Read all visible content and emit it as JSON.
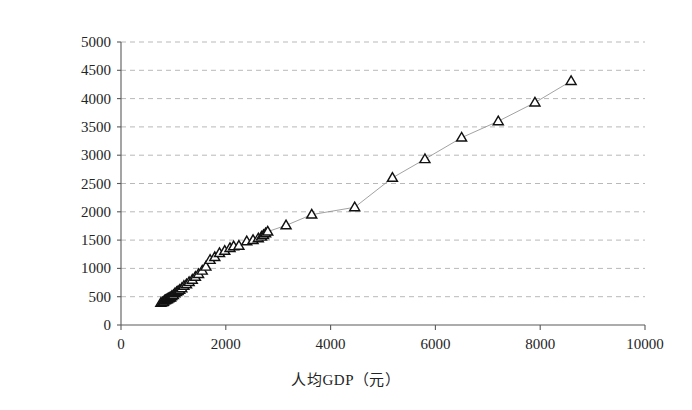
{
  "chart_data": {
    "type": "scatter",
    "title": "",
    "subtitle": "",
    "xlabel": "人均GDP（元）",
    "ylabel": "人均消费（元）",
    "xlim": [
      0,
      10000
    ],
    "ylim": [
      0,
      5000
    ],
    "xticks": [
      0,
      2000,
      4000,
      6000,
      8000,
      10000
    ],
    "yticks": [
      0,
      500,
      1000,
      1500,
      2000,
      2500,
      3000,
      3500,
      4000,
      4500,
      5000
    ],
    "xtick_labels": [
      "0",
      "2000",
      "4000",
      "6000",
      "8000",
      "10000"
    ],
    "ytick_labels": [
      "0",
      "500",
      "1000",
      "1500",
      "2000",
      "2500",
      "3000",
      "3500",
      "4000",
      "4500",
      "5000"
    ],
    "grid": true,
    "grid_axis": "y",
    "grid_style": "dashed",
    "legend": false,
    "legend_position": "none",
    "marker": "triangle-up",
    "marker_fill": "#ffffff",
    "marker_edge": "#111111",
    "connector_line": true,
    "connector_color": "#8a8a8a",
    "series": [
      {
        "name": "人均消费 vs 人均GDP",
        "x": [
          760,
          790,
          810,
          830,
          850,
          870,
          890,
          910,
          930,
          950,
          970,
          1000,
          1030,
          1060,
          1090,
          1120,
          1160,
          1200,
          1250,
          1300,
          1360,
          1420,
          1480,
          1550,
          1620,
          1700,
          1790,
          1880,
          1980,
          2080,
          2150,
          2250,
          2400,
          2520,
          2620,
          2680,
          2720,
          2760,
          2800,
          3150,
          3640,
          4460,
          5180,
          5800,
          6500,
          7200,
          7900,
          8590
        ],
        "y": [
          390,
          400,
          410,
          430,
          440,
          450,
          460,
          470,
          480,
          490,
          510,
          530,
          560,
          580,
          600,
          620,
          650,
          690,
          720,
          760,
          800,
          850,
          900,
          960,
          1030,
          1150,
          1200,
          1270,
          1310,
          1360,
          1390,
          1400,
          1480,
          1500,
          1530,
          1560,
          1590,
          1620,
          1650,
          1760,
          1950,
          2080,
          2600,
          2930,
          3310,
          3600,
          3930,
          4310
        ]
      }
    ]
  },
  "axes": {
    "x_title": "人均GDP（元）",
    "y_title": "人均消费（元）"
  }
}
